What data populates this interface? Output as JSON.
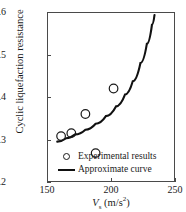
{
  "chart_data": {
    "type": "scatter",
    "title": "",
    "xlabel": "V_s (m/s²)",
    "xlabel_symbol": "V",
    "xlabel_subscript": "s",
    "xlabel_units": "(m/s",
    "xlabel_exponent": "2",
    "xlabel_units_close": ")",
    "ylabel": "Cyclic liquefaction resistance",
    "xlim": [
      150,
      250
    ],
    "ylim": [
      0.2,
      0.6
    ],
    "xticks": [
      150,
      200,
      250
    ],
    "xticklabels": [
      "150",
      "200",
      "250"
    ],
    "yticks": [
      0.2,
      0.3,
      0.4,
      0.5,
      0.6
    ],
    "yticklabels": [
      "0.2",
      "0.3",
      "0.4",
      "0.5",
      "0.6"
    ],
    "grid": false,
    "legend_position": "lower-left-inside",
    "series": [
      {
        "name": "Experimental results",
        "type": "scatter",
        "marker": "open-circle",
        "color": "#1a1a1a",
        "points": [
          {
            "x": 161,
            "y": 0.308
          },
          {
            "x": 169,
            "y": 0.315
          },
          {
            "x": 180,
            "y": 0.36
          },
          {
            "x": 188,
            "y": 0.268
          },
          {
            "x": 202,
            "y": 0.42
          }
        ]
      },
      {
        "name": "Approximate curve",
        "type": "line",
        "color": "#111111",
        "points": [
          {
            "x": 158,
            "y": 0.295
          },
          {
            "x": 165,
            "y": 0.303
          },
          {
            "x": 172,
            "y": 0.312
          },
          {
            "x": 180,
            "y": 0.323
          },
          {
            "x": 188,
            "y": 0.337
          },
          {
            "x": 196,
            "y": 0.355
          },
          {
            "x": 204,
            "y": 0.378
          },
          {
            "x": 211,
            "y": 0.406
          },
          {
            "x": 217,
            "y": 0.437
          },
          {
            "x": 223,
            "y": 0.48
          },
          {
            "x": 228,
            "y": 0.525
          },
          {
            "x": 232,
            "y": 0.57
          },
          {
            "x": 234,
            "y": 0.593
          }
        ]
      }
    ]
  },
  "legend": {
    "entries": [
      {
        "label": "Experimental results",
        "key": "open-circle"
      },
      {
        "label": "Approximate curve",
        "key": "solid-line"
      }
    ]
  }
}
